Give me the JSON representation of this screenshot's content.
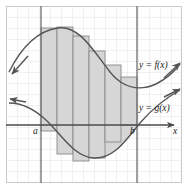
{
  "figure": {
    "background_color": "#ffffff",
    "frame_color": "#bdbdbd",
    "grid": {
      "minor_color": "#d9d9d9",
      "major_color": "#9a9a9a",
      "cell_px": 11,
      "cols": 16,
      "rows": 16,
      "visible": true
    },
    "colors": {
      "curve": "#555555",
      "shaded_region": "#d6d6d6",
      "rectangle_stroke": "#8a8a8a",
      "axis": "#4a4a4a",
      "vertical_line": "#6e6e6e",
      "label_text": "#1a1a1a"
    },
    "labels": {
      "f_curve": "y = f(x)",
      "g_curve": "y = g(x)",
      "left_bound": "a",
      "right_bound": "b",
      "x_axis": "x"
    },
    "axes": {
      "x_axis_y_px": 119,
      "x_axis_arrow": "right",
      "x_axis_label": "x"
    },
    "bounds": {
      "a_x_px": 35,
      "b_x_px": 131,
      "a_label": "a",
      "b_label": "b"
    },
    "curves": [
      {
        "name": "f",
        "label": "y = f(x)",
        "label_x_px": 133,
        "label_y_px": 62,
        "arrows": [
          "left-down",
          "right-up"
        ],
        "path": "M 3 66 C 14 44, 30 25, 52 22 C 74 19, 88 46, 104 66 C 116 81, 132 86, 150 78 C 160 73, 168 66, 174 58"
      },
      {
        "name": "g",
        "label": "y = g(x)",
        "label_x_px": 133,
        "label_y_px": 104,
        "arrows": [
          "left-up",
          "right-up"
        ],
        "path": "M 3 97 C 14 97, 26 101, 40 114 C 56 129, 68 151, 88 152 C 108 153, 120 134, 134 117 C 146 103, 160 92, 174 84"
      }
    ],
    "rectangles": [
      {
        "index": 1,
        "x_px": 35,
        "width_px": 16,
        "top_px": 22,
        "bottom_px": 125
      },
      {
        "index": 2,
        "x_px": 51,
        "width_px": 16,
        "top_px": 21,
        "bottom_px": 148
      },
      {
        "index": 3,
        "x_px": 67,
        "width_px": 16,
        "top_px": 30,
        "bottom_px": 155
      },
      {
        "index": 4,
        "x_px": 83,
        "width_px": 16,
        "top_px": 45,
        "bottom_px": 152
      },
      {
        "index": 5,
        "x_px": 99,
        "width_px": 16,
        "top_px": 59,
        "bottom_px": 136
      },
      {
        "index": 6,
        "x_px": 115,
        "width_px": 16,
        "top_px": 71,
        "bottom_px": 119
      }
    ],
    "rectangle_count": 6
  }
}
